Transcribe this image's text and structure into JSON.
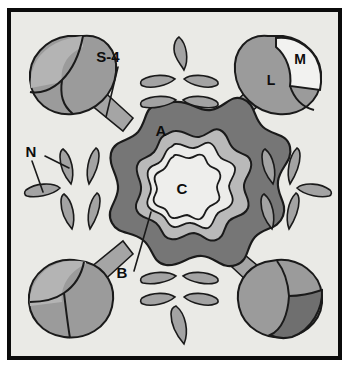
{
  "figure": {
    "kind": "biological-schematic",
    "canvas": {
      "width": 349,
      "height": 367
    },
    "frame": {
      "outer_margin_color": "#ffffff",
      "border_color": "#0b0b0b",
      "border_width": 4,
      "interior_background": "#e9e9e5",
      "x": 9,
      "y": 10,
      "width": 331,
      "height": 348
    }
  },
  "colors": {
    "background": "#e9e9e5",
    "outline": "#1a1a1a",
    "ring_outer_dark": "#767676",
    "ring_middle_light": "#b9b9b9",
    "ring_inner_pale": "#ececea",
    "core_white": "#eeeeec",
    "lobe_body": "#9b9b9b",
    "lobe_highlight": "#b4b4b4",
    "lobe_dark_wedge": "#6f6f6f",
    "lobe_white_wedge": "#f2f2f0",
    "spoke": "#a5a5a5",
    "leaf": "#a3a3a3",
    "leader_line": "#1a1a1a",
    "label_text": "#0d0d0d"
  },
  "labels": [
    {
      "id": "label-s4",
      "text": "S-4",
      "x": 108,
      "y": 61,
      "size": 14,
      "describes": "spoke / stalk of upper-left lobed body"
    },
    {
      "id": "label-m",
      "text": "M",
      "x": 297,
      "y": 62,
      "size": 14,
      "describes": "pale wedge region of upper-right lobed body"
    },
    {
      "id": "label-l",
      "text": "L",
      "x": 271,
      "y": 85,
      "size": 14,
      "describes": "large gray region of upper-right lobed body"
    },
    {
      "id": "label-a",
      "text": "A",
      "x": 159,
      "y": 134,
      "size": 14,
      "describes": "outer dark wavy ring of central rosette"
    },
    {
      "id": "label-n",
      "text": "N",
      "x": 31,
      "y": 154,
      "size": 14,
      "describes": "leaf-shaped bodies at left"
    },
    {
      "id": "label-c",
      "text": "C",
      "x": 181,
      "y": 192,
      "size": 14,
      "describes": "pale wavy core of central rosette"
    },
    {
      "id": "label-b",
      "text": "B",
      "x": 123,
      "y": 276,
      "size": 14,
      "describes": "middle band of central rosette"
    }
  ],
  "leader_lines": [
    {
      "id": "leader-s4",
      "x1": 118,
      "y1": 67,
      "x2": 106,
      "y2": 117,
      "for": "S-4"
    },
    {
      "id": "leader-n-1",
      "x1": 32,
      "y1": 161,
      "x2": 43,
      "y2": 190,
      "for": "N"
    },
    {
      "id": "leader-n-2",
      "x1": 45,
      "y1": 157,
      "x2": 68,
      "y2": 167,
      "for": "N"
    },
    {
      "id": "leader-b",
      "x1": 133,
      "y1": 272,
      "x2": 150,
      "y2": 213,
      "for": "B"
    }
  ],
  "central_rosette": {
    "center_x": 175,
    "center_y": 186,
    "lobes": 9,
    "rings": [
      {
        "name": "A",
        "label": "A",
        "outer_radius": 84,
        "inner_radius": 66,
        "fill": "#767676",
        "role": "outer dark wavy cortex"
      },
      {
        "name": "B",
        "label": "B",
        "outer_radius": 55,
        "inner_radius": 45,
        "fill": "#b9b9b9",
        "role": "middle gray band"
      },
      {
        "name": "ring-pale",
        "label": "",
        "outer_radius": 45,
        "inner_radius": 36,
        "fill": "#ececea",
        "role": "pale transition band"
      },
      {
        "name": "C",
        "label": "C",
        "outer_radius": 36,
        "inner_radius": 0,
        "fill": "#eeeeec",
        "role": "pale wavy core"
      }
    ]
  },
  "lobed_bodies": [
    {
      "id": "lobe-top-left",
      "label": "",
      "cx": 71,
      "cy": 75,
      "angle_deg": 225,
      "has_dark_wedge": false,
      "has_white_wedge": false,
      "notch": true
    },
    {
      "id": "lobe-top-right",
      "label": "L / M",
      "cx": 281,
      "cy": 72,
      "angle_deg": 315,
      "has_dark_wedge": false,
      "has_white_wedge": true,
      "notch": true
    },
    {
      "id": "lobe-bottom-left",
      "label": "",
      "cx": 70,
      "cy": 297,
      "angle_deg": 135,
      "has_dark_wedge": false,
      "has_white_wedge": false,
      "notch": true
    },
    {
      "id": "lobe-bottom-right",
      "label": "",
      "cx": 284,
      "cy": 298,
      "angle_deg": 45,
      "has_dark_wedge": true,
      "has_white_wedge": false,
      "notch": true
    }
  ],
  "spokes": [
    {
      "id": "spoke-top-left",
      "x1": 120,
      "y1": 125,
      "x2": 95,
      "y2": 103
    },
    {
      "id": "spoke-top-right",
      "x1": 232,
      "y1": 124,
      "x2": 259,
      "y2": 100
    },
    {
      "id": "spoke-bottom-left",
      "x1": 121,
      "y1": 248,
      "x2": 94,
      "y2": 272
    },
    {
      "id": "spoke-bottom-right",
      "x1": 231,
      "y1": 248,
      "x2": 259,
      "y2": 271
    }
  ],
  "leaf_clusters": [
    {
      "id": "cluster-top",
      "position": "top",
      "count": 5,
      "leaves": [
        {
          "cx": 181,
          "cy": 53,
          "rx": 7,
          "ry": 17,
          "rot": 8
        },
        {
          "cx": 156,
          "cy": 81,
          "rx": 17,
          "ry": 8,
          "rot": -12
        },
        {
          "cx": 202,
          "cy": 81,
          "rx": 17,
          "ry": 8,
          "rot": 12
        },
        {
          "cx": 157,
          "cy": 102,
          "rx": 16,
          "ry": 8,
          "rot": -6
        },
        {
          "cx": 201,
          "cy": 102,
          "rx": 16,
          "ry": 8,
          "rot": 6
        }
      ]
    },
    {
      "id": "cluster-left",
      "position": "left",
      "count": 5,
      "leaves": [
        {
          "cx": 40,
          "cy": 190,
          "rx": 17,
          "ry": 8,
          "rot": -4
        },
        {
          "cx": 68,
          "cy": 165,
          "rx": 8,
          "ry": 17,
          "rot": 10
        },
        {
          "cx": 90,
          "cy": 163,
          "rx": 8,
          "ry": 17,
          "rot": -10
        },
        {
          "cx": 70,
          "cy": 209,
          "rx": 8,
          "ry": 17,
          "rot": -8
        },
        {
          "cx": 92,
          "cy": 209,
          "rx": 8,
          "ry": 17,
          "rot": 8
        }
      ]
    },
    {
      "id": "cluster-right",
      "position": "right",
      "count": 5,
      "leaves": [
        {
          "cx": 270,
          "cy": 165,
          "rx": 8,
          "ry": 17,
          "rot": 10
        },
        {
          "cx": 293,
          "cy": 163,
          "rx": 8,
          "ry": 17,
          "rot": -10
        },
        {
          "cx": 269,
          "cy": 209,
          "rx": 8,
          "ry": 17,
          "rot": -8
        },
        {
          "cx": 291,
          "cy": 209,
          "rx": 8,
          "ry": 17,
          "rot": 8
        },
        {
          "cx": 317,
          "cy": 190,
          "rx": 17,
          "ry": 8,
          "rot": 4
        }
      ]
    },
    {
      "id": "cluster-bottom",
      "position": "bottom",
      "count": 5,
      "leaves": [
        {
          "cx": 157,
          "cy": 277,
          "rx": 16,
          "ry": 8,
          "rot": 6
        },
        {
          "cx": 202,
          "cy": 277,
          "rx": 16,
          "ry": 8,
          "rot": -6
        },
        {
          "cx": 156,
          "cy": 298,
          "rx": 17,
          "ry": 8,
          "rot": 12
        },
        {
          "cx": 201,
          "cy": 298,
          "rx": 17,
          "ry": 8,
          "rot": -12
        },
        {
          "cx": 180,
          "cy": 325,
          "rx": 7,
          "ry": 18,
          "rot": -8
        }
      ]
    }
  ]
}
